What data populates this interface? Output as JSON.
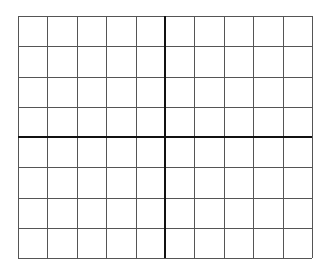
{
  "diagram": {
    "type": "coordinate-grid",
    "columns": 10,
    "rows": 8,
    "grid": {
      "left": 18,
      "top": 16,
      "right": 312,
      "bottom": 258
    },
    "axis_column_index": 5,
    "axis_row_index": 4,
    "colors": {
      "background": "#ffffff",
      "grid_line": "#555555",
      "axis_line": "#111111"
    },
    "line_widths": {
      "grid": 1,
      "axis": 2
    }
  }
}
